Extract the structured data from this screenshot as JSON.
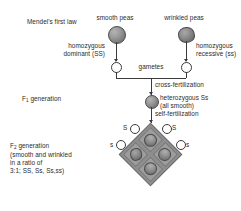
{
  "figure": {
    "title": "Mendel's first law"
  },
  "parents": {
    "left": {
      "phenotype_label": "smooth peas",
      "genotype_label_line1": "homozygous",
      "genotype_label_line2": "dominant (SS)",
      "allele": "S",
      "pea_type": "smooth"
    },
    "right": {
      "phenotype_label": "wrinkled peas",
      "genotype_label_line1": "homozygous",
      "genotype_label_line2": "recessive (ss)",
      "allele": "s",
      "pea_type": "wrinkled"
    }
  },
  "gametes": {
    "label": "gametes",
    "left_allele": "S",
    "right_allele": "s"
  },
  "cross": {
    "label": "cross-fertilization"
  },
  "f1": {
    "generation_label": "F",
    "generation_subscript": "1",
    "generation_suffix": " generation",
    "genotype_line1": "heterozygous Ss",
    "genotype_line2": "(all smooth)",
    "pea_type": "smooth"
  },
  "self_cross": {
    "label": "self-fertilization"
  },
  "punnett": {
    "top_left_allele": "S",
    "top_right_allele": "S",
    "left_allele": "s",
    "right_allele": "s",
    "cells": [
      {
        "position": "top",
        "genotype": "SS",
        "phenotype": "smooth"
      },
      {
        "position": "left",
        "genotype": "Ss",
        "phenotype": "smooth"
      },
      {
        "position": "right",
        "genotype": "Ss",
        "phenotype": "smooth"
      },
      {
        "position": "bottom",
        "genotype": "ss",
        "phenotype": "wrinkled"
      }
    ]
  },
  "f2": {
    "line1_prefix": "F",
    "line1_subscript": "2",
    "line1_suffix": " generation",
    "line2": "(smooth and wrinkled",
    "line3": "in a ratio of",
    "line4": "3:1; SS, Ss, Ss,ss)"
  },
  "colors": {
    "ink": "#2b2b2b",
    "line": "#3a3a3a",
    "pea_fill": "#8d8d8d",
    "grid_fill": "#9d9d9d",
    "background": "#ffffff"
  }
}
